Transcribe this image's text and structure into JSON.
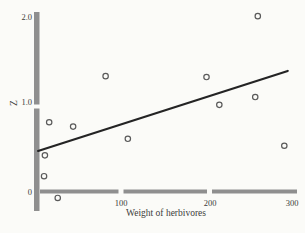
{
  "chart_data": {
    "type": "scatter",
    "title": "",
    "xlabel": "Weight of herbivores",
    "ylabel": "Z",
    "xlim": [
      0,
      310
    ],
    "ylim": [
      -0.15,
      2.1
    ],
    "x_ticks": [
      "100",
      "200",
      "300"
    ],
    "y_ticks": [
      "0",
      "1.0",
      "2.0"
    ],
    "grid": false,
    "legend": "none",
    "points": [
      [
        16,
        0.79
      ],
      [
        44,
        0.74
      ],
      [
        11,
        0.41
      ],
      [
        10,
        0.17
      ],
      [
        26,
        -0.08
      ],
      [
        82,
        1.32
      ],
      [
        108,
        0.6
      ],
      [
        200,
        1.31
      ],
      [
        215,
        0.99
      ],
      [
        257,
        1.08
      ],
      [
        260,
        2.01
      ],
      [
        291,
        0.52
      ]
    ],
    "trend_line": {
      "x1": 3,
      "y1": 0.46,
      "x2": 295,
      "y2": 1.38
    },
    "colors": {
      "background": "#fbfbf8",
      "axis": "#8f8f8f",
      "point_stroke": "#5a5a5a",
      "trend": "#242424",
      "text": "#3b3b3b"
    }
  }
}
